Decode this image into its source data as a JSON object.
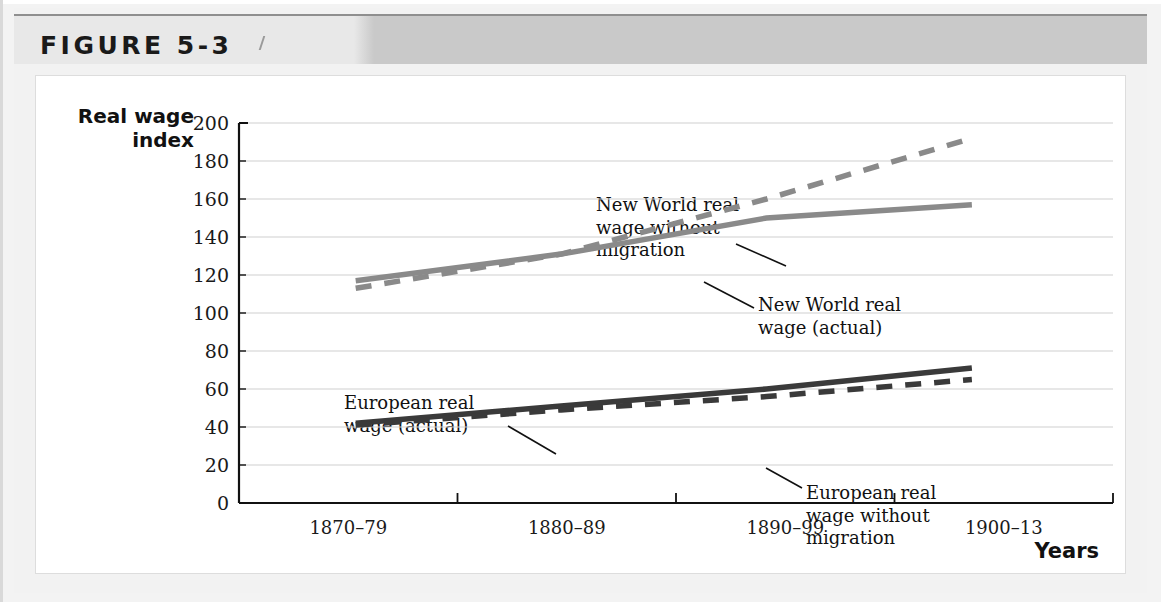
{
  "figure": {
    "header_label": "FIGURE 5-3"
  },
  "chart_data": {
    "type": "line",
    "title": "",
    "xlabel": "Years",
    "ylabel": "Real wage index",
    "ylabel_line1": "Real wage",
    "ylabel_line2": "index",
    "categories": [
      "1870–79",
      "1880–89",
      "1890–99",
      "1900–13"
    ],
    "ylim": [
      0,
      200
    ],
    "ytick_step": 20,
    "yticks": [
      200,
      180,
      160,
      140,
      120,
      100,
      80,
      60,
      40,
      20,
      0
    ],
    "grid": true,
    "legend_position": "inline-annotations",
    "series": [
      {
        "name": "New World real wage without migration",
        "style": "dashed",
        "color": "#8a8a8a",
        "values": [
          113,
          131,
          160,
          192
        ]
      },
      {
        "name": "New World real wage (actual)",
        "style": "solid",
        "color": "#8a8a8a",
        "values": [
          117,
          131,
          150,
          157
        ]
      },
      {
        "name": "European real wage (actual)",
        "style": "solid",
        "color": "#3a3a3a",
        "values": [
          42,
          51,
          60,
          71
        ]
      },
      {
        "name": "European real wage without migration",
        "style": "dashed",
        "color": "#3a3a3a",
        "values": [
          41,
          49,
          56,
          65
        ]
      }
    ],
    "annotations": [
      {
        "id": "new-world-without-migration",
        "text": "New World real\nwage without\nmigration",
        "x": 560,
        "y": 118
      },
      {
        "id": "new-world-actual",
        "text": "New World real\nwage (actual)",
        "x": 722,
        "y": 218
      },
      {
        "id": "european-actual",
        "text": "European real\nwage (actual)",
        "x": 308,
        "y": 316
      },
      {
        "id": "european-without-migration",
        "text": "European real\nwage without\nmigration",
        "x": 770,
        "y": 406
      }
    ]
  }
}
